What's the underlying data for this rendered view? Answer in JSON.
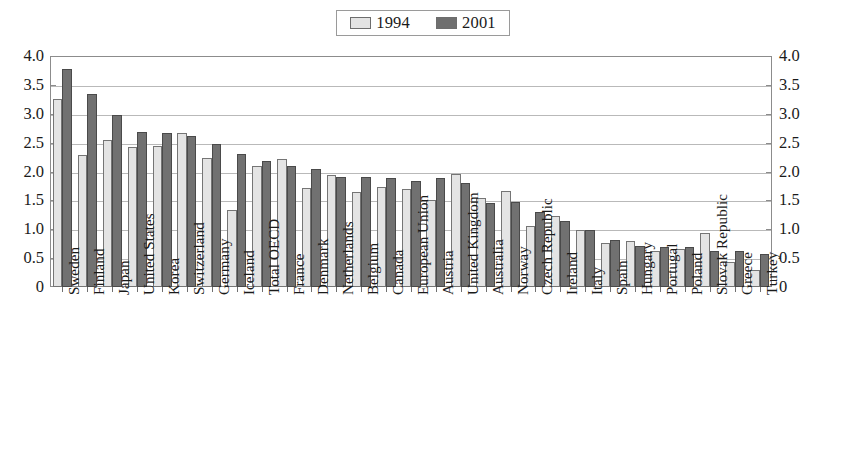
{
  "chart_data": {
    "type": "bar",
    "title": "",
    "subtitle": "",
    "xlabel": "",
    "ylabel": "",
    "ylim": [
      0,
      4.0
    ],
    "ytick_labels": [
      "4.0",
      "3.5",
      "3.0",
      "2.5",
      "2.0",
      "1.5",
      "1.0",
      "0.5",
      "0"
    ],
    "ytick_values": [
      4.0,
      3.5,
      3.0,
      2.5,
      2.0,
      1.5,
      1.0,
      0.5,
      0
    ],
    "grid": true,
    "legend_position": "top-center",
    "dual_y_axis": true,
    "categories": [
      "Sweden",
      "Finland",
      "Japan",
      "United States",
      "Korea",
      "Switzerland",
      "Germany",
      "Iceland",
      "Total OECD",
      "France",
      "Denmark",
      "Netherlands",
      "Belgium",
      "Canada",
      "European Union",
      "Austria",
      "United Kingdom",
      "Australia",
      "Norway",
      "Czech Republic",
      "Ireland",
      "Italy",
      "Spain",
      "Hungary",
      "Portugal",
      "Poland",
      "Slovak Republic",
      "Greece",
      "Turkey"
    ],
    "series": [
      {
        "name": "1994",
        "color": "#e4e4e4",
        "values": [
          3.25,
          2.28,
          2.55,
          2.43,
          2.45,
          2.66,
          2.23,
          1.34,
          2.1,
          2.22,
          1.72,
          1.94,
          1.65,
          1.74,
          1.7,
          1.51,
          1.95,
          1.54,
          1.67,
          1.05,
          1.23,
          0.98,
          0.77,
          0.8,
          0.63,
          0.66,
          0.93,
          0.43,
          0.3
        ]
      },
      {
        "name": "2001",
        "color": "#717171",
        "values": [
          3.78,
          3.34,
          2.98,
          2.68,
          2.67,
          2.62,
          2.48,
          2.31,
          2.18,
          2.1,
          2.05,
          1.9,
          1.9,
          1.89,
          1.83,
          1.88,
          1.8,
          1.45,
          1.48,
          1.3,
          1.14,
          0.98,
          0.82,
          0.71,
          0.7,
          0.7,
          0.63,
          0.62,
          0.58
        ]
      }
    ]
  },
  "legend": {
    "entries": [
      {
        "label": "1994",
        "swatch": "light-gray-swatch"
      },
      {
        "label": "2001",
        "swatch": "dark-gray-swatch"
      }
    ]
  },
  "axis": {
    "left_ticks": [
      "4.0",
      "3.5",
      "3.0",
      "2.5",
      "2.0",
      "1.5",
      "1.0",
      "0.5",
      "0"
    ],
    "right_ticks": [
      "4.0",
      "3.5",
      "3.0",
      "2.5",
      "2.0",
      "1.5",
      "1.0",
      "0.5",
      "0"
    ]
  },
  "colors": {
    "series_1994": "#e4e4e4",
    "series_2001": "#717171",
    "gridline": "#b9b9b9",
    "frame": "#8c8c8c",
    "text": "#1a1a1a",
    "background": "#ffffff"
  }
}
